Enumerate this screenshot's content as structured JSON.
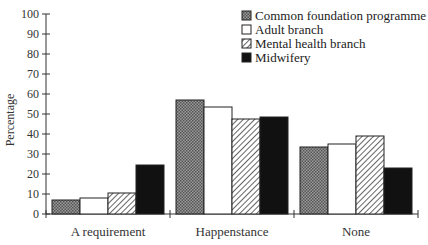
{
  "chart_data": {
    "type": "bar",
    "title": "",
    "xlabel": "",
    "ylabel": "Percentage",
    "ylim": [
      0,
      100
    ],
    "yticks": [
      0,
      10,
      20,
      30,
      40,
      50,
      60,
      70,
      80,
      90,
      100
    ],
    "grid": false,
    "legend_position": "top-right",
    "categories": [
      "A requirement",
      "Happenstance",
      "None"
    ],
    "series": [
      {
        "name": "Common foundation programme",
        "pattern": "dotted-gray",
        "values": [
          7,
          57,
          33.5
        ]
      },
      {
        "name": "Adult branch",
        "pattern": "white",
        "values": [
          8,
          53.5,
          35
        ]
      },
      {
        "name": "Mental health branch",
        "pattern": "hatched",
        "values": [
          10.5,
          47.5,
          39
        ]
      },
      {
        "name": "Midwifery",
        "pattern": "black",
        "values": [
          24.5,
          48.5,
          23
        ]
      }
    ]
  }
}
